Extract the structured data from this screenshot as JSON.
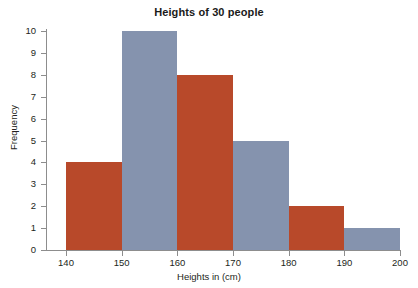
{
  "chart_data": {
    "type": "bar",
    "title": "Heights of 30 people",
    "xlabel": "Heights in (cm)",
    "ylabel": "Frequency",
    "categories": [
      "140-150",
      "150-160",
      "160-170",
      "170-180",
      "180-190",
      "190-200"
    ],
    "bin_edges": [
      140,
      150,
      160,
      170,
      180,
      190,
      200
    ],
    "values": [
      4,
      10,
      8,
      5,
      2,
      1
    ],
    "bar_colors": [
      "#b8492a",
      "#8593ae",
      "#b8492a",
      "#8593ae",
      "#b8492a",
      "#8593ae"
    ],
    "xlim": [
      140,
      200
    ],
    "ylim": [
      0,
      10
    ],
    "x_ticks": [
      140,
      150,
      160,
      170,
      180,
      190,
      200
    ],
    "x_tick_labels": [
      "140",
      "150",
      "160",
      "170",
      "180",
      "190",
      "200"
    ],
    "y_ticks": [
      0,
      1,
      2,
      3,
      4,
      5,
      6,
      7,
      8,
      9,
      10
    ],
    "y_tick_labels": [
      "0",
      "1",
      "2",
      "3",
      "4",
      "5",
      "6",
      "7",
      "8",
      "9",
      "10"
    ],
    "grid": false,
    "legend": null,
    "total_count": 30,
    "colors": {
      "red": "#b8492a",
      "blue_gray": "#8593ae",
      "axis": "#8d8d8d",
      "text": "#231f20",
      "background": "#ffffff"
    }
  }
}
